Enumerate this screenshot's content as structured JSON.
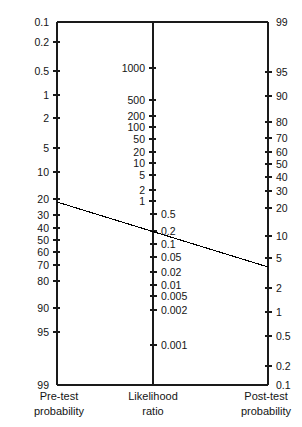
{
  "chart_data": {
    "type": "line",
    "title": "",
    "subtitle": "",
    "grid": false,
    "legend": null,
    "axes": [
      {
        "id": "pretest",
        "name": "pre-test-probability-axis",
        "caption_line1": "Pre-test",
        "caption_line2": "probability",
        "label_side": "left",
        "scale": "logit-percent",
        "range": [
          0.1,
          99
        ],
        "direction": "increasing-downward",
        "ticks": [
          {
            "label": "0.1",
            "value": 0.1,
            "y": 22
          },
          {
            "label": "0.2",
            "value": 0.2,
            "y": 42
          },
          {
            "label": "0.5",
            "value": 0.5,
            "y": 71
          },
          {
            "label": "1",
            "value": 1,
            "y": 95
          },
          {
            "label": "2",
            "value": 2,
            "y": 118
          },
          {
            "label": "5",
            "value": 5,
            "y": 148
          },
          {
            "label": "10",
            "value": 10,
            "y": 172
          },
          {
            "label": "20",
            "value": 20,
            "y": 199
          },
          {
            "label": "30",
            "value": 30,
            "y": 215
          },
          {
            "label": "40",
            "value": 40,
            "y": 228
          },
          {
            "label": "50",
            "value": 50,
            "y": 240
          },
          {
            "label": "60",
            "value": 60,
            "y": 252
          },
          {
            "label": "70",
            "value": 70,
            "y": 265
          },
          {
            "label": "80",
            "value": 80,
            "y": 281
          },
          {
            "label": "90",
            "value": 90,
            "y": 308
          },
          {
            "label": "95",
            "value": 95,
            "y": 332
          },
          {
            "label": "99",
            "value": 99,
            "y": 385
          }
        ]
      },
      {
        "id": "likelihood",
        "name": "likelihood-ratio-axis",
        "caption_line1": "Likelihood",
        "caption_line2": "ratio",
        "label_side": "mixed",
        "scale": "log",
        "range": [
          0.001,
          1000
        ],
        "direction": "decreasing-downward",
        "ticks": [
          {
            "label": "1000",
            "value": 1000,
            "y": 68,
            "side": "left"
          },
          {
            "label": "500",
            "value": 500,
            "y": 100,
            "side": "left"
          },
          {
            "label": "200",
            "value": 200,
            "y": 116,
            "side": "left"
          },
          {
            "label": "100",
            "value": 100,
            "y": 127,
            "side": "left"
          },
          {
            "label": "50",
            "value": 50,
            "y": 139,
            "side": "left"
          },
          {
            "label": "20",
            "value": 20,
            "y": 152,
            "side": "left"
          },
          {
            "label": "10",
            "value": 10,
            "y": 163,
            "side": "left"
          },
          {
            "label": "5",
            "value": 5,
            "y": 175,
            "side": "left"
          },
          {
            "label": "2",
            "value": 2,
            "y": 190,
            "side": "left"
          },
          {
            "label": "1",
            "value": 1,
            "y": 201,
            "side": "left"
          },
          {
            "label": "0.5",
            "value": 0.5,
            "y": 214,
            "side": "right"
          },
          {
            "label": "0.2",
            "value": 0.2,
            "y": 231,
            "side": "right"
          },
          {
            "label": "0.1",
            "value": 0.1,
            "y": 244,
            "side": "right"
          },
          {
            "label": "0.05",
            "value": 0.05,
            "y": 257,
            "side": "right"
          },
          {
            "label": "0.02",
            "value": 0.02,
            "y": 272,
            "side": "right"
          },
          {
            "label": "0.01",
            "value": 0.01,
            "y": 285,
            "side": "right"
          },
          {
            "label": "0.005",
            "value": 0.005,
            "y": 296,
            "side": "right"
          },
          {
            "label": "0.002",
            "value": 0.002,
            "y": 310,
            "side": "right"
          },
          {
            "label": "0.001",
            "value": 0.001,
            "y": 345,
            "side": "right"
          }
        ]
      },
      {
        "id": "posttest",
        "name": "post-test-probability-axis",
        "caption_line1": "Post-test",
        "caption_line2": "probability",
        "label_side": "right",
        "scale": "logit-percent",
        "range": [
          0.1,
          99
        ],
        "direction": "decreasing-downward",
        "ticks": [
          {
            "label": "99",
            "value": 99,
            "y": 22
          },
          {
            "label": "95",
            "value": 95,
            "y": 72
          },
          {
            "label": "90",
            "value": 90,
            "y": 96
          },
          {
            "label": "80",
            "value": 80,
            "y": 122
          },
          {
            "label": "70",
            "value": 70,
            "y": 138
          },
          {
            "label": "60",
            "value": 60,
            "y": 152
          },
          {
            "label": "50",
            "value": 50,
            "y": 164
          },
          {
            "label": "40",
            "value": 40,
            "y": 177
          },
          {
            "label": "30",
            "value": 30,
            "y": 191
          },
          {
            "label": "20",
            "value": 20,
            "y": 208
          },
          {
            "label": "10",
            "value": 10,
            "y": 236
          },
          {
            "label": "5",
            "value": 5,
            "y": 258
          },
          {
            "label": "2",
            "value": 2,
            "y": 288
          },
          {
            "label": "1",
            "value": 1,
            "y": 312
          },
          {
            "label": "0.5",
            "value": 0.5,
            "y": 336
          },
          {
            "label": "0.2",
            "value": 0.2,
            "y": 366
          },
          {
            "label": "0.1",
            "value": 0.1,
            "y": 385
          }
        ]
      }
    ],
    "frame": {
      "top_y": 22,
      "bottom_y": 385,
      "left_x": 57,
      "center_x": 153,
      "right_x": 268
    },
    "connector": {
      "name": "nomogram-connector-line",
      "x1": 57,
      "y1": 202,
      "x2": 268,
      "y2": 267,
      "pretest_probability": 25,
      "likelihood_ratio": 0.15,
      "posttest_probability": 4.5
    }
  },
  "captions": {
    "pretest_line1": "Pre-test",
    "pretest_line2": "probability",
    "likelihood_line1": "Likelihood",
    "likelihood_line2": "ratio",
    "posttest_line1": "Post-test",
    "posttest_line2": "probability"
  }
}
